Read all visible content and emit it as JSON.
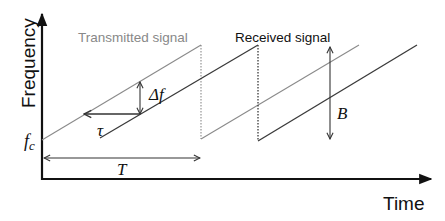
{
  "diagram": {
    "type": "FMCW chirp frequency-time diagram",
    "axes": {
      "y_label": "Frequency",
      "x_label": "Time"
    },
    "signals": {
      "transmitted_label": "Transmitted signal",
      "received_label": "Received signal",
      "transmitted_color": "#8a8a8a",
      "received_color": "#3a3a3a"
    },
    "annotations": {
      "carrier": "f",
      "carrier_sub": "c",
      "delay": "τ",
      "freq_shift": "Δf",
      "period": "T",
      "bandwidth": "B"
    },
    "colors": {
      "axis": "#111111",
      "arrow": "#333333",
      "label_gray": "#888888",
      "text_dark": "#111111"
    }
  }
}
